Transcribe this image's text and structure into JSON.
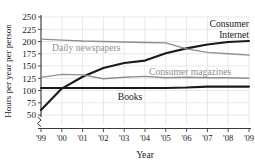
{
  "chart_data": {
    "type": "line",
    "title": "",
    "xlabel": "Year",
    "ylabel": "Hours per year per person",
    "x": [
      "'99",
      "'00",
      "'01",
      "'02",
      "'03",
      "'04",
      "'05",
      "'06",
      "'07",
      "'08",
      "'09"
    ],
    "categories": [
      "'99",
      "'00",
      "'01",
      "'02",
      "'03",
      "'04",
      "'05",
      "'06",
      "'07",
      "'08",
      "'09"
    ],
    "yticks": [
      50,
      75,
      100,
      125,
      150,
      175,
      200,
      225,
      250
    ],
    "ylim": [
      45,
      250
    ],
    "xlim": [
      "'99",
      "'09"
    ],
    "grid": true,
    "axis_break": true,
    "legend": "inline-labels",
    "series": [
      {
        "name": "Consumer Internet",
        "label_lines": [
          "Consumer",
          "Internet"
        ],
        "color": "#1a1a1a",
        "width": 2.1,
        "values": [
          60,
          104,
          128,
          146,
          156,
          161,
          176,
          186,
          194,
          199,
          201
        ]
      },
      {
        "name": "Daily newspapers",
        "label_lines": [
          "Daily newspapers"
        ],
        "color": "#8f8f8f",
        "width": 1.3,
        "values": [
          205,
          203,
          201,
          200,
          199,
          198,
          197,
          185,
          178,
          175,
          172
        ]
      },
      {
        "name": "Consumer magazines",
        "label_lines": [
          "Consumer magazines"
        ],
        "color": "#8f8f8f",
        "width": 1.3,
        "values": [
          127,
          133,
          132,
          124,
          127,
          129,
          126,
          127,
          126,
          126,
          125
        ]
      },
      {
        "name": "Books",
        "label_lines": [
          "Books"
        ],
        "color": "#1a1a1a",
        "width": 2.1,
        "values": [
          105,
          105,
          105,
          105,
          105,
          105,
          105,
          106,
          108,
          108,
          108
        ]
      }
    ],
    "annotations": [
      {
        "name": "consumer-internet-label",
        "text": "Consumer Internet",
        "color": "#1a1a1a"
      },
      {
        "name": "daily-newspapers-label",
        "text": "Daily newspapers",
        "color": "#8f8f8f"
      },
      {
        "name": "consumer-magazines-label",
        "text": "Consumer magazines",
        "color": "#8f8f8f"
      },
      {
        "name": "books-label",
        "text": "Books",
        "color": "#1a1a1a"
      }
    ]
  },
  "labels": {
    "y_axis_title": "Hours per year per person",
    "x_axis_title": "Year",
    "internet_line1": "Consumer",
    "internet_line2": "Internet",
    "newspapers": "Daily newspapers",
    "magazines": "Consumer magazines",
    "books": "Books"
  },
  "yticks": {
    "t250": "250",
    "t225": "225",
    "t200": "200",
    "t175": "175",
    "t150": "150",
    "t125": "125",
    "t100": "100",
    "t75": "75",
    "t50": "50"
  },
  "xticks": {
    "x99": "'99",
    "x00": "'00",
    "x01": "'01",
    "x02": "'02",
    "x03": "'03",
    "x04": "'04",
    "x05": "'05",
    "x06": "'06",
    "x07": "'07",
    "x08": "'08",
    "x09": "'09"
  },
  "colors": {
    "grid": "#d8d8d8",
    "axis": "#3a3a3a",
    "dark_series": "#1a1a1a",
    "gray_series": "#8f8f8f",
    "text": "#1a1a1a"
  }
}
